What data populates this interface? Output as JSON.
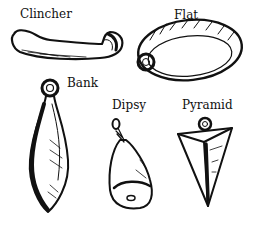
{
  "figure": {
    "ink_color": "#111111",
    "background": "#ffffff",
    "items": [
      {
        "label": "Clincher",
        "icon": "clincher-sinker-icon"
      },
      {
        "label": "Flat",
        "icon": "flat-sinker-icon"
      },
      {
        "label": "Bank",
        "icon": "bank-sinker-icon"
      },
      {
        "label": "Dipsy",
        "icon": "dipsy-sinker-icon"
      },
      {
        "label": "Pyramid",
        "icon": "pyramid-sinker-icon"
      }
    ]
  }
}
